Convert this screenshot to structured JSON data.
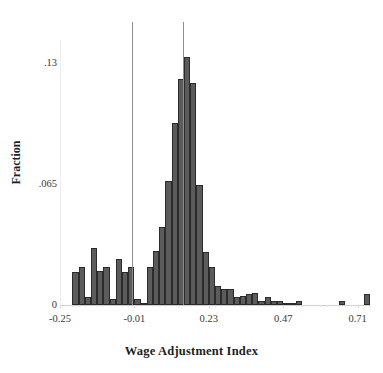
{
  "chart_data": {
    "type": "bar",
    "title": "",
    "xlabel": "Wage Adjustment Index",
    "ylabel": "Fraction",
    "xlim": [
      -0.25,
      0.75
    ],
    "ylim": [
      0,
      0.1425
    ],
    "grid": false,
    "legend": null,
    "bin_width": 0.02,
    "xticks": [
      -0.25,
      -0.01,
      0.23,
      0.47,
      0.71
    ],
    "xtick_labels": [
      "-0.25",
      "-0.01",
      "0.23",
      "0.47",
      "0.71"
    ],
    "yticks": [
      0,
      0.065,
      0.13
    ],
    "ytick_labels": [
      "0",
      ".065",
      ".13"
    ],
    "bar_color": "#5b5b5b",
    "bar_edge_color": "#2b2b2b",
    "reference_lines": [
      {
        "name": "reference-line-left",
        "x": -0.017,
        "color": "#8e8e8e"
      },
      {
        "name": "reference-line-right",
        "x": 0.148,
        "color": "#8e8e8e"
      }
    ],
    "bins": [
      {
        "x": -0.21,
        "value": 0.0175
      },
      {
        "x": -0.19,
        "value": 0.0205
      },
      {
        "x": -0.17,
        "value": 0.0045
      },
      {
        "x": -0.15,
        "value": 0.0305
      },
      {
        "x": -0.13,
        "value": 0.0185
      },
      {
        "x": -0.11,
        "value": 0.0205
      },
      {
        "x": -0.09,
        "value": 0.003
      },
      {
        "x": -0.07,
        "value": 0.0245
      },
      {
        "x": -0.05,
        "value": 0.018
      },
      {
        "x": -0.03,
        "value": 0.0205
      },
      {
        "x": -0.01,
        "value": 0.003
      },
      {
        "x": 0.01,
        "value": 0.0012
      },
      {
        "x": 0.03,
        "value": 0.0205
      },
      {
        "x": 0.05,
        "value": 0.029
      },
      {
        "x": 0.07,
        "value": 0.042
      },
      {
        "x": 0.09,
        "value": 0.0665
      },
      {
        "x": 0.11,
        "value": 0.098
      },
      {
        "x": 0.13,
        "value": 0.1215
      },
      {
        "x": 0.15,
        "value": 0.1335
      },
      {
        "x": 0.17,
        "value": 0.1195
      },
      {
        "x": 0.19,
        "value": 0.0645
      },
      {
        "x": 0.21,
        "value": 0.0285
      },
      {
        "x": 0.23,
        "value": 0.0205
      },
      {
        "x": 0.25,
        "value": 0.0102
      },
      {
        "x": 0.27,
        "value": 0.0085
      },
      {
        "x": 0.29,
        "value": 0.0085
      },
      {
        "x": 0.31,
        "value": 0.0045
      },
      {
        "x": 0.33,
        "value": 0.005
      },
      {
        "x": 0.35,
        "value": 0.006
      },
      {
        "x": 0.37,
        "value": 0.0062
      },
      {
        "x": 0.39,
        "value": 0.0022
      },
      {
        "x": 0.41,
        "value": 0.0045
      },
      {
        "x": 0.43,
        "value": 0.002
      },
      {
        "x": 0.45,
        "value": 0.002
      },
      {
        "x": 0.47,
        "value": 0.001
      },
      {
        "x": 0.49,
        "value": 0.001
      },
      {
        "x": 0.51,
        "value": 0.0022
      },
      {
        "x": 0.65,
        "value": 0.0022
      },
      {
        "x": 0.73,
        "value": 0.006
      }
    ]
  }
}
